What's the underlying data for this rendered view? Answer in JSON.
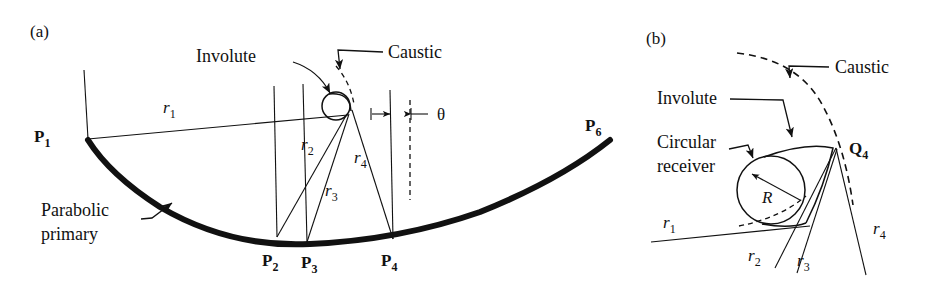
{
  "figure": {
    "type": "optics-ray-diagram",
    "background": "#ffffff",
    "ink": "#111111",
    "panels": [
      {
        "id": "a",
        "label": "(a)",
        "annotations": [
          {
            "name": "involute",
            "text": "Involute"
          },
          {
            "name": "caustic",
            "text": "Caustic"
          },
          {
            "name": "parabolic-primary-line1",
            "text": "Parabolic"
          },
          {
            "name": "parabolic-primary-line2",
            "text": "primary"
          },
          {
            "name": "theta",
            "text": "θ"
          }
        ],
        "points": [
          {
            "name": "P1",
            "base": "P",
            "sub": "1"
          },
          {
            "name": "P2",
            "base": "P",
            "sub": "2"
          },
          {
            "name": "P3",
            "base": "P",
            "sub": "3"
          },
          {
            "name": "P4",
            "base": "P",
            "sub": "4"
          },
          {
            "name": "P6",
            "base": "P",
            "sub": "6"
          }
        ],
        "rays": [
          {
            "name": "r1",
            "base": "r",
            "sub": "1"
          },
          {
            "name": "r2",
            "base": "r",
            "sub": "2"
          },
          {
            "name": "r3",
            "base": "r",
            "sub": "3"
          },
          {
            "name": "r4",
            "base": "r",
            "sub": "4"
          }
        ]
      },
      {
        "id": "b",
        "label": "(b)",
        "annotations": [
          {
            "name": "caustic",
            "text": "Caustic"
          },
          {
            "name": "involute",
            "text": "Involute"
          },
          {
            "name": "circular-receiver-line1",
            "text": "Circular"
          },
          {
            "name": "circular-receiver-line2",
            "text": "receiver"
          },
          {
            "name": "radius",
            "text": "R"
          }
        ],
        "points": [
          {
            "name": "Q4",
            "base": "Q",
            "sub": "4"
          }
        ],
        "rays": [
          {
            "name": "r1",
            "base": "r",
            "sub": "1"
          },
          {
            "name": "r2",
            "base": "r",
            "sub": "2"
          },
          {
            "name": "r3",
            "base": "r",
            "sub": "3"
          },
          {
            "name": "r4",
            "base": "r",
            "sub": "4"
          }
        ]
      }
    ]
  },
  "panel_a": {
    "label": "(a)",
    "involute_label": "Involute",
    "caustic_label": "Caustic",
    "primary_line1": "Parabolic",
    "primary_line2": "primary",
    "theta_label": "θ",
    "p1_base": "P",
    "p1_sub": "1",
    "p2_base": "P",
    "p2_sub": "2",
    "p3_base": "P",
    "p3_sub": "3",
    "p4_base": "P",
    "p4_sub": "4",
    "p6_base": "P",
    "p6_sub": "6",
    "r1_base": "r",
    "r1_sub": "1",
    "r2_base": "r",
    "r2_sub": "2",
    "r3_base": "r",
    "r3_sub": "3",
    "r4_base": "r",
    "r4_sub": "4"
  },
  "panel_b": {
    "label": "(b)",
    "caustic_label": "Caustic",
    "involute_label": "Involute",
    "receiver_line1": "Circular",
    "receiver_line2": "receiver",
    "radius_label": "R",
    "q4_base": "Q",
    "q4_sub": "4",
    "r1_base": "r",
    "r1_sub": "1",
    "r2_base": "r",
    "r2_sub": "2",
    "r3_base": "r",
    "r3_sub": "3",
    "r4_base": "r",
    "r4_sub": "4"
  }
}
